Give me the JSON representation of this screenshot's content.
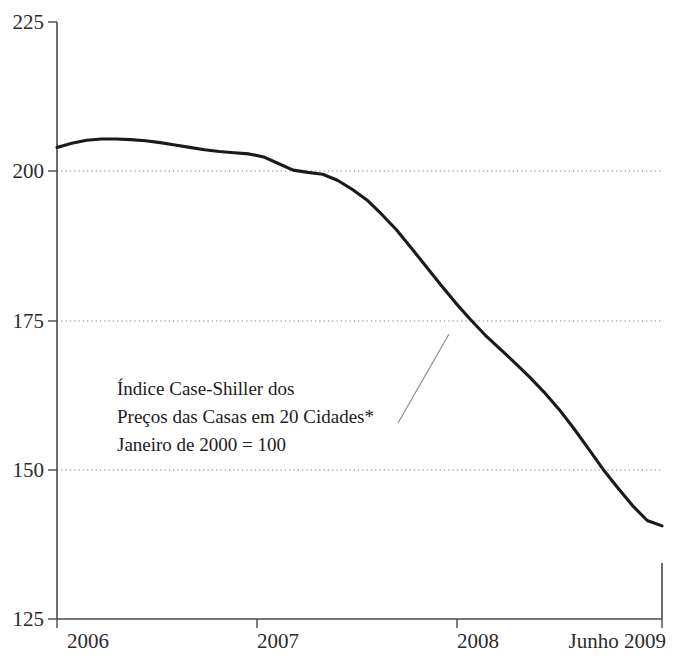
{
  "chart_data": {
    "type": "line",
    "title": "",
    "subtitle": "",
    "xlabel": "",
    "ylabel": "",
    "grid": true,
    "legend_position": "none",
    "ylim": [
      125,
      225
    ],
    "xlim": [
      "2006-01",
      "2009-06"
    ],
    "y_ticks": [
      225,
      200,
      175,
      150,
      125
    ],
    "y_tick_labels": [
      "225",
      "200",
      "175",
      "150",
      "125"
    ],
    "x_ticks": [
      "2006",
      "2007",
      "2008",
      "Junho 2009"
    ],
    "x_tick_labels": [
      "2006",
      "2007",
      "2008",
      "Junho 2009"
    ],
    "annotations": [
      {
        "name": "series-callout",
        "lines": [
          "Índice Case-Shiller dos",
          "Preços das Casas em 20 Cidades*",
          "Janeiro de 2000 = 100"
        ],
        "leader_from": "2007-10",
        "leader_to": "2007-11"
      }
    ],
    "series": [
      {
        "name": "Índice Case-Shiller dos Preços das Casas em 20 Cidades",
        "units": "Janeiro de 2000 = 100",
        "color": "#1a1a1a",
        "x": [
          "2006-01",
          "2006-02",
          "2006-03",
          "2006-04",
          "2006-05",
          "2006-06",
          "2006-07",
          "2006-08",
          "2006-09",
          "2006-10",
          "2006-11",
          "2006-12",
          "2007-01",
          "2007-02",
          "2007-03",
          "2007-04",
          "2007-05",
          "2007-06",
          "2007-07",
          "2007-08",
          "2007-09",
          "2007-10",
          "2007-11",
          "2007-12",
          "2008-01",
          "2008-02",
          "2008-03",
          "2008-04",
          "2008-05",
          "2008-06",
          "2008-07",
          "2008-08",
          "2008-09",
          "2008-10",
          "2008-11",
          "2008-12",
          "2009-01",
          "2009-02",
          "2009-03",
          "2009-04",
          "2009-05",
          "2009-06"
        ],
        "values": [
          204.0,
          204.7,
          205.2,
          205.4,
          205.4,
          205.3,
          205.1,
          204.8,
          204.4,
          204.0,
          203.6,
          203.3,
          203.1,
          202.9,
          202.4,
          201.3,
          200.2,
          199.8,
          199.5,
          198.5,
          197.0,
          195.2,
          192.8,
          190.2,
          187.2,
          184.1,
          181.0,
          178.0,
          175.2,
          172.6,
          170.3,
          168.0,
          165.6,
          163.0,
          160.2,
          157.0,
          153.6,
          150.1,
          147.0,
          144.0,
          141.5,
          140.6
        ]
      }
    ],
    "footnote_marker": "*"
  }
}
